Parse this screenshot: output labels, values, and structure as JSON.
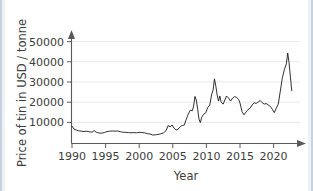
{
  "chart_data": {
    "type": "line",
    "title": "",
    "xlabel": "Year",
    "ylabel": "Price of tin in USD / tonne",
    "xlim": [
      1989.4,
      2023.2
    ],
    "ylim": [
      0,
      53000
    ],
    "grid": true,
    "legend": false,
    "xticks": [
      1990,
      1995,
      2000,
      2005,
      2010,
      2015,
      2020
    ],
    "xtick_labels": [
      "1990",
      "1995",
      "2000",
      "2005",
      "2010",
      "2015",
      "2020"
    ],
    "yticks": [
      10000,
      20000,
      30000,
      40000,
      50000
    ],
    "ytick_labels": [
      "10000",
      "20000",
      "30000",
      "40000",
      "50000"
    ],
    "line_color": "#1a1a1a",
    "grid_color": "#e9e9e9",
    "axis_color": "#5a5a5a",
    "series": [
      {
        "name": "Price of tin",
        "x": [
          1990.0,
          1990.3,
          1990.7,
          1991.0,
          1991.4,
          1991.8,
          1992.2,
          1992.6,
          1993.0,
          1993.3,
          1993.6,
          1994.0,
          1994.4,
          1994.8,
          1995.2,
          1995.6,
          1996.0,
          1996.4,
          1996.8,
          1997.2,
          1997.6,
          1998.0,
          1998.4,
          1998.8,
          1999.2,
          1999.6,
          2000.0,
          2000.4,
          2000.8,
          2001.2,
          2001.6,
          2002.0,
          2002.4,
          2002.8,
          2003.2,
          2003.6,
          2004.0,
          2004.3,
          2004.6,
          2004.9,
          2005.2,
          2005.5,
          2005.8,
          2006.1,
          2006.4,
          2006.7,
          2007.0,
          2007.3,
          2007.6,
          2007.9,
          2008.1,
          2008.3,
          2008.5,
          2008.7,
          2008.9,
          2009.1,
          2009.3,
          2009.6,
          2009.9,
          2010.2,
          2010.5,
          2010.8,
          2011.0,
          2011.2,
          2011.4,
          2011.6,
          2011.8,
          2012.0,
          2012.2,
          2012.5,
          2012.8,
          2013.0,
          2013.3,
          2013.6,
          2013.9,
          2014.2,
          2014.5,
          2014.8,
          2015.0,
          2015.3,
          2015.6,
          2015.9,
          2016.2,
          2016.5,
          2016.8,
          2017.1,
          2017.4,
          2017.7,
          2018.0,
          2018.3,
          2018.6,
          2018.9,
          2019.2,
          2019.5,
          2019.8,
          2020.1,
          2020.4,
          2020.7,
          2021.0,
          2021.3,
          2021.6,
          2021.9,
          2022.1,
          2022.3,
          2022.5,
          2022.7
        ],
        "y": [
          8600,
          7100,
          6600,
          6300,
          6100,
          5900,
          6100,
          5800,
          5600,
          6400,
          5600,
          5200,
          5100,
          5400,
          5900,
          6100,
          6200,
          6100,
          6200,
          5800,
          5600,
          5500,
          5400,
          5300,
          5400,
          5300,
          5500,
          5400,
          5300,
          4900,
          4700,
          4200,
          4300,
          4500,
          4800,
          5200,
          6400,
          8900,
          8200,
          9200,
          7500,
          6700,
          7100,
          8300,
          8900,
          9100,
          12000,
          14500,
          16500,
          16200,
          18500,
          23300,
          21500,
          17000,
          12000,
          10300,
          13000,
          14500,
          15200,
          17800,
          19000,
          24500,
          26500,
          32000,
          28500,
          24000,
          21000,
          23500,
          20500,
          19500,
          22000,
          23500,
          22500,
          21000,
          22500,
          23200,
          22800,
          21800,
          20000,
          15800,
          14200,
          15600,
          16800,
          17500,
          19000,
          20200,
          19800,
          20500,
          21300,
          20200,
          19500,
          19800,
          19100,
          18400,
          17000,
          15300,
          17500,
          19500,
          26000,
          32500,
          36500,
          39500,
          44800,
          40000,
          33000,
          26200
        ]
      }
    ]
  },
  "axis_titles": {
    "x": "Year",
    "y": "Price of tin in USD / tonne"
  }
}
